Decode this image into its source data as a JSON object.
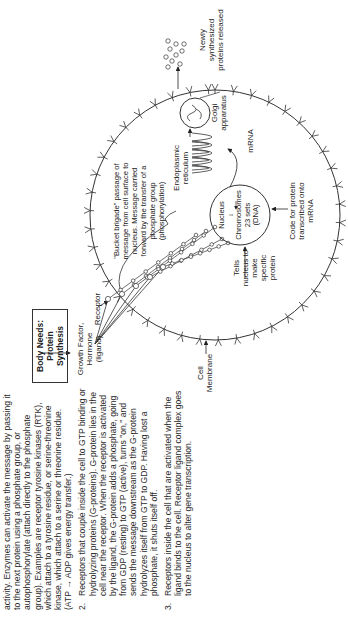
{
  "text": {
    "intro": "activity. Enzymes can activate the message by passing it to the next protein using a phosphate group, or autophosphorylate (attach directly to the phosphate group). Examples are receptor tyrosine kinases (RTK), which attach to a tyrosine residue, or serine-threonine kinase, which attach to a serine or threonine residue. (ATP → ADP gives energy transfer.)",
    "items": [
      {
        "num": "2.",
        "body": "Receptors that couple inside the cell to GTP binding or hydrolyzing proteins (G-proteins). G-protein lies in the cell near the receptor. When the receptor is activated by the ligand, the G-protein adds a phosphate, going from GDP (resting) to GTP (active), turns \"on,\" and sends the message downstream as the G-protein hydrolyzes itself from GTP to GDP. Having lost a phosphate, it shuts itself off."
      },
      {
        "num": "3.",
        "body": "Receptors inside the cell that are activated when the ligand binds to the cell. Receptor ligand complex goes to the nucleus to alter gene transcription."
      }
    ]
  },
  "diagram": {
    "box_line1": "Body Needs:",
    "box_line2": "Protein Synthesis",
    "ligand_line1": "Growth Factor, Hormone",
    "ligand_line2": "(ligand)",
    "receptor": "Receptor",
    "membrane_line1": "Cell",
    "membrane_line2": "Membrane",
    "bucket": "\"Bucket brigade\" passage of message from cell surface to nucleus. Message carried forward by the transfer of a phosphate group (phosphorylation)",
    "tells_nucleus": "Tells nucleus to make specific protein",
    "nucleus": "Nucleus",
    "chromosomes": "Chromosomes",
    "sets": "23 sets",
    "dna": "(DNA)",
    "code_for_protein": "Code for protein transcribed onto mRNA",
    "er": "Endoplasmic reticulum",
    "mrna": "mRNA",
    "golgi": "Golgi apparatus",
    "released": "Newly synthesized proteins released"
  }
}
